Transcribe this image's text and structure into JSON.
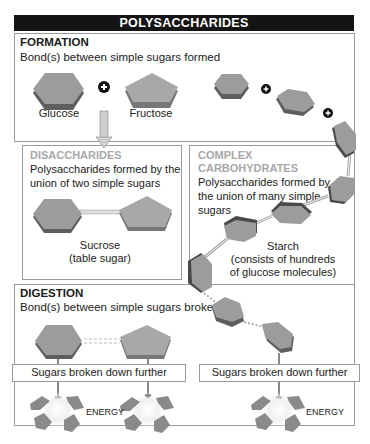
{
  "title": "POLYSACCHARIDES",
  "formation": {
    "heading": "FORMATION",
    "description": "Bond(s) between simple sugars formed",
    "molecules": [
      "Glucose",
      "Fructose"
    ]
  },
  "disaccharides": {
    "heading": "DISACCHARIDES",
    "description_line1": "Polysaccharides formed by the",
    "description_line2": "union of two simple sugars",
    "example_line1": "Sucrose",
    "example_line2": "(table sugar)"
  },
  "complex_carbohydrates": {
    "heading_line1": "COMPLEX",
    "heading_line2": "CARBOHYDRATES",
    "description_line1": "Polysaccharides formed by",
    "description_line2": "the union of many simple",
    "description_line3": "sugars",
    "example_line1": "Starch",
    "example_line2": "(consists of hundreds",
    "example_line3": "of glucose molecules)"
  },
  "digestion": {
    "heading": "DIGESTION",
    "description": "Bond(s) between simple sugars broken",
    "step_left": "Sugars broken down further",
    "step_right": "Sugars broken down further",
    "energy_labels": [
      "ENERGY",
      "ENERGY"
    ]
  },
  "colors": {
    "title_bg": "#141414",
    "molecule_fill": "#9c9c9c",
    "molecule_edge": "#5a5a5a",
    "border": "#9a9a9a",
    "subheading_gray": "#a8a8a8"
  }
}
